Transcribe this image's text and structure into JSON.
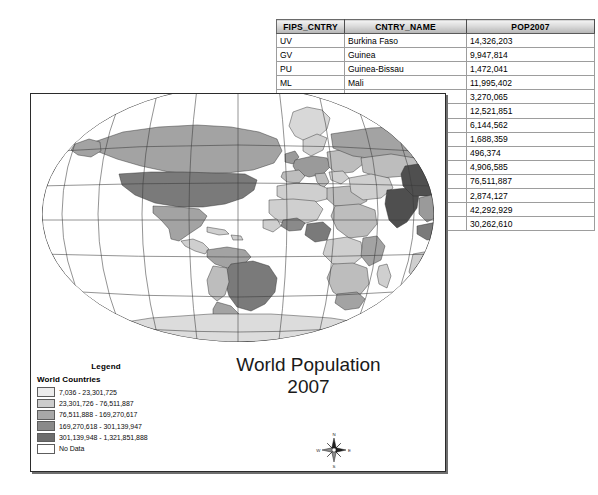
{
  "attribute_table": {
    "name": "attribute-table",
    "columns": [
      "FIPS_CNTRY",
      "CNTRY_NAME",
      "POP2007"
    ],
    "rows": [
      {
        "fips": "UV",
        "name": "Burkina Faso",
        "pop": "14,326,203"
      },
      {
        "fips": "GV",
        "name": "Guinea",
        "pop": "9,947,814"
      },
      {
        "fips": "PU",
        "name": "Guinea-Bissau",
        "pop": "1,472,041"
      },
      {
        "fips": "ML",
        "name": "Mali",
        "pop": "11,995,402"
      },
      {
        "fips": "",
        "name": "",
        "pop": "3,270,065"
      },
      {
        "fips": "",
        "name": "",
        "pop": "12,521,851"
      },
      {
        "fips": "",
        "name": "",
        "pop": "6,144,562"
      },
      {
        "fips": "",
        "name": "",
        "pop": "1,688,359"
      },
      {
        "fips": "",
        "name": "",
        "pop": "496,374"
      },
      {
        "fips": "",
        "name": "",
        "pop": "4,906,585"
      },
      {
        "fips": "",
        "name": "",
        "pop": "76,511,887"
      },
      {
        "fips": "",
        "name": "",
        "pop": "2,874,127"
      },
      {
        "fips": "",
        "name": "",
        "pop": "42,292,929"
      },
      {
        "fips": "",
        "name": "",
        "pop": "30,262,610"
      }
    ]
  },
  "map": {
    "title_line1": "World Population",
    "title_line2": "2007",
    "legend": {
      "heading": "Legend",
      "layer_name": "World Countries",
      "classes": [
        {
          "label": "7,036 - 23,301,725",
          "color": "#ececec"
        },
        {
          "label": "23,301,726 - 76,511,887",
          "color": "#cccccc"
        },
        {
          "label": "76,511,888 - 169,270,617",
          "color": "#a8a8a8"
        },
        {
          "label": "169,270,618 - 301,139,947",
          "color": "#8a8a8a"
        },
        {
          "label": "301,139,948 - 1,321,851,888",
          "color": "#6d6d6d"
        },
        {
          "label": "No Data",
          "color": "#ffffff"
        }
      ]
    },
    "compass": {
      "north": "N",
      "south": "S",
      "east": "E",
      "west": "W"
    }
  }
}
